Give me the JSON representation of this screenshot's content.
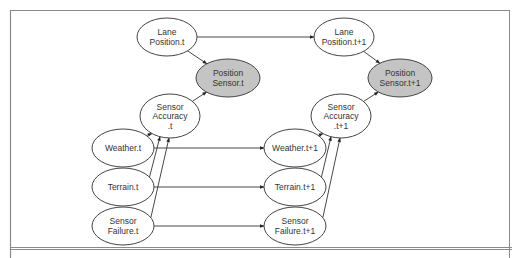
{
  "diagram": {
    "type": "dynamic-bayesian-network",
    "colors": {
      "observed_fill": "#c4c4c4",
      "hidden_fill": "#ffffff",
      "stroke": "#444444"
    },
    "nodes": [
      {
        "id": "lane_t",
        "lines": [
          "Lane",
          "Position.t"
        ],
        "cx": 167,
        "cy": 37,
        "rx": 30,
        "ry": 19,
        "observed": false
      },
      {
        "id": "possensor_t",
        "lines": [
          "Position",
          "Sensor.t"
        ],
        "cx": 228,
        "cy": 78,
        "rx": 32,
        "ry": 19,
        "observed": true
      },
      {
        "id": "acc_t",
        "lines": [
          "Sensor",
          "Accuracy",
          ".t"
        ],
        "cx": 170,
        "cy": 116,
        "rx": 30,
        "ry": 22,
        "observed": false
      },
      {
        "id": "weather_t",
        "lines": [
          "Weather.t"
        ],
        "cx": 123,
        "cy": 148,
        "rx": 31,
        "ry": 19,
        "observed": false
      },
      {
        "id": "terrain_t",
        "lines": [
          "Terrain.t"
        ],
        "cx": 123,
        "cy": 187,
        "rx": 31,
        "ry": 19,
        "observed": false
      },
      {
        "id": "fail_t",
        "lines": [
          "Sensor",
          "Failure.t"
        ],
        "cx": 123,
        "cy": 226,
        "rx": 31,
        "ry": 19,
        "observed": false
      },
      {
        "id": "lane_t1",
        "lines": [
          "Lane",
          "Position.t+1"
        ],
        "cx": 344,
        "cy": 37,
        "rx": 30,
        "ry": 19,
        "observed": false
      },
      {
        "id": "possensor_t1",
        "lines": [
          "Position",
          "Sensor.t+1"
        ],
        "cx": 400,
        "cy": 78,
        "rx": 32,
        "ry": 19,
        "observed": true
      },
      {
        "id": "acc_t1",
        "lines": [
          "Sensor",
          "Accuracy",
          ".t+1"
        ],
        "cx": 341,
        "cy": 116,
        "rx": 30,
        "ry": 22,
        "observed": false
      },
      {
        "id": "weather_t1",
        "lines": [
          "Weather.t+1"
        ],
        "cx": 295,
        "cy": 148,
        "rx": 31,
        "ry": 19,
        "observed": false
      },
      {
        "id": "terrain_t1",
        "lines": [
          "Terrain.t+1"
        ],
        "cx": 295,
        "cy": 187,
        "rx": 31,
        "ry": 19,
        "observed": false
      },
      {
        "id": "fail_t1",
        "lines": [
          "Sensor",
          "Failure.t+1"
        ],
        "cx": 295,
        "cy": 226,
        "rx": 31,
        "ry": 19,
        "observed": false
      }
    ],
    "edges": [
      {
        "from": "lane_t",
        "to": "possensor_t"
      },
      {
        "from": "acc_t",
        "to": "possensor_t"
      },
      {
        "from": "weather_t",
        "to": "acc_t"
      },
      {
        "from": "terrain_t",
        "to": "acc_t"
      },
      {
        "from": "fail_t",
        "to": "acc_t"
      },
      {
        "from": "lane_t1",
        "to": "possensor_t1"
      },
      {
        "from": "acc_t1",
        "to": "possensor_t1"
      },
      {
        "from": "weather_t1",
        "to": "acc_t1"
      },
      {
        "from": "terrain_t1",
        "to": "acc_t1"
      },
      {
        "from": "fail_t1",
        "to": "acc_t1"
      },
      {
        "from": "lane_t",
        "to": "lane_t1"
      },
      {
        "from": "weather_t",
        "to": "weather_t1"
      },
      {
        "from": "terrain_t",
        "to": "terrain_t1"
      },
      {
        "from": "fail_t",
        "to": "fail_t1"
      }
    ]
  }
}
